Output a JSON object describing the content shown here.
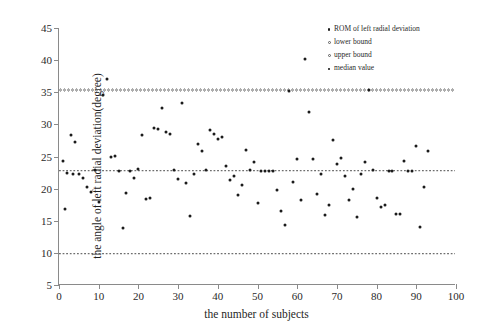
{
  "chart_data": {
    "type": "scatter",
    "title": "",
    "xlabel": "the number of subjects",
    "ylabel": "the angle of left radial deviation(degree)",
    "xlim": [
      0,
      100
    ],
    "ylim": [
      5,
      45
    ],
    "xticks": [
      0,
      10,
      20,
      30,
      40,
      50,
      60,
      70,
      80,
      90,
      100
    ],
    "yticks": [
      5,
      10,
      15,
      20,
      25,
      30,
      35,
      40,
      45
    ],
    "grid": false,
    "legend_position": "top-right",
    "series": [
      {
        "name": "ROM of left radial deviation",
        "marker": "filled-dot",
        "color": "#1b1b1b",
        "points": [
          [
            1,
            24.3
          ],
          [
            1.5,
            16.8
          ],
          [
            2,
            22.4
          ],
          [
            3,
            28.4
          ],
          [
            3.5,
            22.3
          ],
          [
            4,
            27.3
          ],
          [
            5,
            22.3
          ],
          [
            6,
            21.6
          ],
          [
            7,
            20.2
          ],
          [
            8,
            19.5
          ],
          [
            9,
            22.9
          ],
          [
            10,
            17.9
          ],
          [
            11,
            34.6
          ],
          [
            12,
            37.1
          ],
          [
            13,
            25.0
          ],
          [
            14,
            25.1
          ],
          [
            15,
            22.8
          ],
          [
            16,
            13.8
          ],
          [
            17,
            19.3
          ],
          [
            18,
            22.8
          ],
          [
            19,
            21.7
          ],
          [
            20,
            23.0
          ],
          [
            21,
            28.3
          ],
          [
            22,
            18.4
          ],
          [
            23,
            18.6
          ],
          [
            24,
            29.5
          ],
          [
            25,
            29.3
          ],
          [
            26,
            32.6
          ],
          [
            27,
            28.8
          ],
          [
            28,
            28.5
          ],
          [
            29,
            22.9
          ],
          [
            30,
            21.5
          ],
          [
            31,
            33.4
          ],
          [
            32,
            20.8
          ],
          [
            33,
            15.7
          ],
          [
            34,
            22.3
          ],
          [
            35,
            27.0
          ],
          [
            36,
            25.8
          ],
          [
            37,
            22.9
          ],
          [
            38,
            29.2
          ],
          [
            39,
            28.5
          ],
          [
            40,
            27.8
          ],
          [
            41,
            28.0
          ],
          [
            42,
            23.5
          ],
          [
            43,
            21.4
          ],
          [
            44,
            22.0
          ],
          [
            45,
            19.0
          ],
          [
            46,
            20.5
          ],
          [
            47,
            26.0
          ],
          [
            48,
            22.9
          ],
          [
            49,
            24.1
          ],
          [
            50,
            17.8
          ],
          [
            51,
            22.8
          ],
          [
            52,
            22.8
          ],
          [
            53,
            22.8
          ],
          [
            54,
            22.8
          ],
          [
            55,
            19.8
          ],
          [
            56,
            16.5
          ],
          [
            57,
            14.4
          ],
          [
            58,
            35.2
          ],
          [
            59,
            21.1
          ],
          [
            60,
            24.6
          ],
          [
            61,
            18.3
          ],
          [
            62,
            40.1
          ],
          [
            63,
            32.0
          ],
          [
            64,
            24.6
          ],
          [
            65,
            19.2
          ],
          [
            66,
            22.3
          ],
          [
            67,
            15.9
          ],
          [
            68,
            17.4
          ],
          [
            69,
            27.5
          ],
          [
            70,
            23.9
          ],
          [
            71,
            24.8
          ],
          [
            72,
            21.9
          ],
          [
            73,
            18.2
          ],
          [
            74,
            20.0
          ],
          [
            75,
            15.6
          ],
          [
            76,
            22.2
          ],
          [
            77,
            24.2
          ],
          [
            78,
            35.3
          ],
          [
            79,
            22.9
          ],
          [
            80,
            18.6
          ],
          [
            81,
            17.2
          ],
          [
            82,
            17.4
          ],
          [
            83,
            22.8
          ],
          [
            84,
            22.7
          ],
          [
            85,
            16.1
          ],
          [
            86,
            16.1
          ],
          [
            87,
            24.3
          ],
          [
            88,
            22.8
          ],
          [
            89,
            22.8
          ],
          [
            90,
            26.6
          ],
          [
            91,
            14.0
          ],
          [
            92,
            20.3
          ],
          [
            93,
            25.8
          ]
        ]
      }
    ],
    "reference_lines": [
      {
        "name": "lower bound",
        "value": 9.9,
        "style": "square-dotted",
        "color": "#4a4a4a"
      },
      {
        "name": "upper bound",
        "value": 35.3,
        "style": "circle-dotted",
        "color": "#5d5d5d"
      },
      {
        "name": "median value",
        "value": 22.8,
        "style": "square-dotted",
        "color": "#4a4a4a"
      }
    ]
  },
  "legend": {
    "items": [
      {
        "label": "ROM of left radial deviation",
        "marker": "filled-dot"
      },
      {
        "label": "lower bound",
        "marker": "ring-dot"
      },
      {
        "label": "upper bound",
        "marker": "ring-dot"
      },
      {
        "label": "median value",
        "marker": "square-dot"
      }
    ]
  }
}
